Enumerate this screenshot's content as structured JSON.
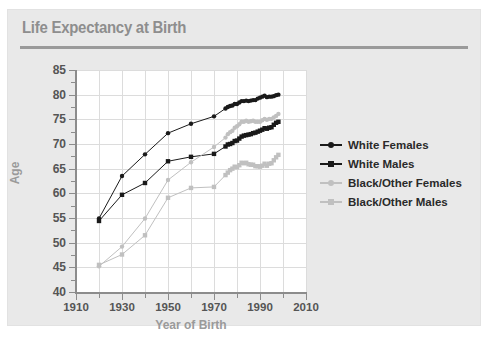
{
  "card": {
    "title": "Life Expectancy at Birth"
  },
  "chart_data": {
    "type": "line",
    "title": "Life Expectancy at Birth",
    "xlabel": "Year of Birth",
    "ylabel": "Age",
    "xlim": [
      1910,
      2010
    ],
    "ylim": [
      40,
      85
    ],
    "xticks": [
      1910,
      1930,
      1950,
      1970,
      1990,
      2010
    ],
    "xticks_minor": [
      1920,
      1940,
      1960,
      1980,
      2000
    ],
    "yticks": [
      40,
      45,
      50,
      55,
      60,
      65,
      70,
      75,
      80,
      85
    ],
    "grid": true,
    "legend_position": "right",
    "marker_dark": "#1a1a1a",
    "marker_light": "#c0c0c0",
    "series": [
      {
        "name": "White Females",
        "color": "#1a1a1a",
        "marker": "circle",
        "x": [
          1920,
          1930,
          1940,
          1950,
          1960,
          1970,
          1975,
          1976,
          1977,
          1978,
          1979,
          1980,
          1981,
          1982,
          1983,
          1984,
          1985,
          1986,
          1987,
          1988,
          1989,
          1990,
          1991,
          1992,
          1993,
          1994,
          1995,
          1996,
          1997,
          1998
        ],
        "values": [
          54.9,
          63.5,
          67.9,
          72.2,
          74.1,
          75.6,
          77.2,
          77.5,
          77.7,
          77.8,
          78.1,
          78.1,
          78.4,
          78.7,
          78.7,
          78.8,
          78.7,
          78.8,
          78.9,
          78.9,
          79.2,
          79.4,
          79.6,
          79.8,
          79.5,
          79.6,
          79.6,
          79.7,
          79.9,
          80.0
        ]
      },
      {
        "name": "White Males",
        "color": "#1a1a1a",
        "marker": "square",
        "x": [
          1920,
          1930,
          1940,
          1950,
          1960,
          1970,
          1975,
          1976,
          1977,
          1978,
          1979,
          1980,
          1981,
          1982,
          1983,
          1984,
          1985,
          1986,
          1987,
          1988,
          1989,
          1990,
          1991,
          1992,
          1993,
          1994,
          1995,
          1996,
          1997,
          1998
        ],
        "values": [
          54.4,
          59.7,
          62.1,
          66.5,
          67.4,
          68.0,
          69.5,
          69.9,
          70.0,
          70.2,
          70.6,
          70.7,
          71.1,
          71.5,
          71.7,
          71.8,
          71.9,
          72.0,
          72.2,
          72.3,
          72.5,
          72.7,
          72.9,
          73.2,
          73.1,
          73.3,
          73.4,
          73.9,
          74.3,
          74.5
        ]
      },
      {
        "name": "Black/Other Females",
        "color": "#c0c0c0",
        "marker": "circle",
        "x": [
          1920,
          1930,
          1940,
          1950,
          1960,
          1970,
          1975,
          1976,
          1977,
          1978,
          1979,
          1980,
          1981,
          1982,
          1983,
          1984,
          1985,
          1986,
          1987,
          1988,
          1989,
          1990,
          1991,
          1992,
          1993,
          1994,
          1995,
          1996,
          1997,
          1998
        ],
        "values": [
          45.2,
          49.2,
          54.9,
          62.7,
          66.3,
          69.4,
          71.3,
          72.0,
          72.4,
          72.7,
          73.3,
          73.6,
          74.0,
          74.5,
          74.5,
          74.7,
          74.5,
          74.6,
          74.7,
          74.5,
          74.5,
          74.5,
          74.8,
          75.1,
          74.9,
          75.1,
          75.1,
          75.4,
          75.7,
          76.1
        ]
      },
      {
        "name": "Black/Other Males",
        "color": "#c0c0c0",
        "marker": "square",
        "x": [
          1920,
          1930,
          1940,
          1950,
          1960,
          1970,
          1975,
          1976,
          1977,
          1978,
          1979,
          1980,
          1981,
          1982,
          1983,
          1984,
          1985,
          1986,
          1987,
          1988,
          1989,
          1990,
          1991,
          1992,
          1993,
          1994,
          1995,
          1996,
          1997,
          1998
        ],
        "values": [
          45.5,
          47.6,
          51.5,
          59.1,
          61.1,
          61.3,
          63.7,
          64.2,
          64.7,
          65.0,
          65.4,
          65.3,
          65.7,
          66.2,
          66.1,
          66.2,
          65.9,
          65.8,
          65.8,
          65.5,
          65.5,
          65.4,
          65.6,
          66.0,
          65.6,
          66.0,
          66.1,
          66.7,
          67.3,
          67.8
        ]
      }
    ]
  },
  "legend": {
    "items": [
      {
        "label": "White Females"
      },
      {
        "label": "White Males"
      },
      {
        "label": "Black/Other Females"
      },
      {
        "label": "Black/Other Males"
      }
    ]
  }
}
